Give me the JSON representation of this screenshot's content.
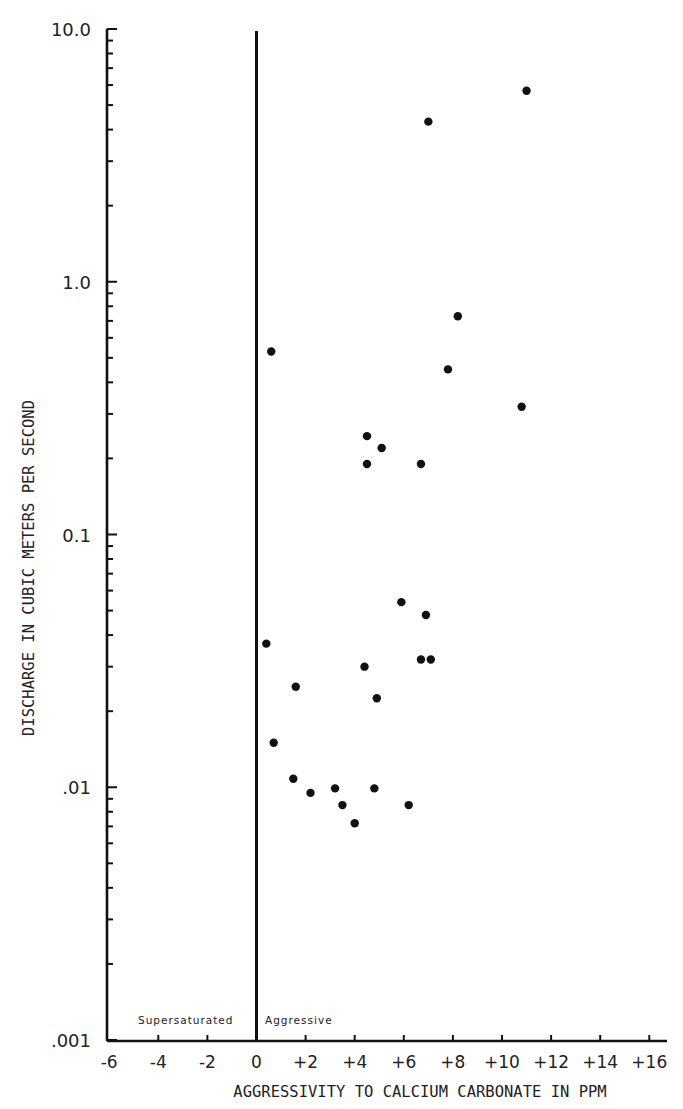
{
  "chart_data": {
    "type": "scatter",
    "title": "",
    "xlabel": "AGGRESSIVITY TO CALCIUM CARBONATE IN PPM",
    "ylabel": "DISCHARGE IN CUBIC METERS PER SECOND",
    "xlim": [
      -6,
      16.7
    ],
    "ylim": [
      0.001,
      10.0
    ],
    "yscale": "log",
    "grid": false,
    "legend": null,
    "x_ticks": [
      -6,
      -4,
      -2,
      0,
      2,
      4,
      6,
      8,
      10,
      12,
      14,
      16
    ],
    "x_tick_labels": [
      "-6",
      "-4",
      "-2",
      "0",
      "+2",
      "+4",
      "+6",
      "+8",
      "+10",
      "+12",
      "+14",
      "+16"
    ],
    "y_ticks": [
      0.001,
      0.01,
      0.1,
      1.0,
      10.0
    ],
    "y_tick_labels": [
      ".001",
      ".01",
      "0.1",
      "1.0",
      "10.0"
    ],
    "reference_line": {
      "x": 0,
      "style": "solid vertical"
    },
    "annotations": [
      {
        "text": "Supersaturated",
        "position": "left of x=0, near bottom"
      },
      {
        "text": "Aggressive",
        "position": "right of x=0, near bottom"
      }
    ],
    "series": [
      {
        "name": "samples",
        "points": [
          {
            "x": 11.0,
            "y": 5.7
          },
          {
            "x": 7.0,
            "y": 4.3
          },
          {
            "x": 8.2,
            "y": 0.73
          },
          {
            "x": 0.6,
            "y": 0.53
          },
          {
            "x": 7.8,
            "y": 0.45
          },
          {
            "x": 10.8,
            "y": 0.32
          },
          {
            "x": 4.5,
            "y": 0.245
          },
          {
            "x": 5.1,
            "y": 0.22
          },
          {
            "x": 4.5,
            "y": 0.19
          },
          {
            "x": 6.7,
            "y": 0.19
          },
          {
            "x": 5.9,
            "y": 0.054
          },
          {
            "x": 6.9,
            "y": 0.048
          },
          {
            "x": 0.4,
            "y": 0.037
          },
          {
            "x": 6.7,
            "y": 0.032
          },
          {
            "x": 7.1,
            "y": 0.032
          },
          {
            "x": 4.4,
            "y": 0.03
          },
          {
            "x": 1.6,
            "y": 0.025
          },
          {
            "x": 4.9,
            "y": 0.0225
          },
          {
            "x": 0.7,
            "y": 0.015
          },
          {
            "x": 1.5,
            "y": 0.0108
          },
          {
            "x": 3.2,
            "y": 0.0099
          },
          {
            "x": 4.8,
            "y": 0.0099
          },
          {
            "x": 2.2,
            "y": 0.0095
          },
          {
            "x": 3.5,
            "y": 0.0085
          },
          {
            "x": 6.2,
            "y": 0.0085
          },
          {
            "x": 4.0,
            "y": 0.0072
          }
        ]
      }
    ]
  },
  "layout": {
    "x_origin_px": 256.5,
    "x_px_per_unit": 24.55,
    "y_top_px": 29,
    "y_px_per_decade": 252.75,
    "axis_left_px": 107,
    "axis_bottom_px": 1041,
    "axis_right_px": 667,
    "point_radius": 4.2,
    "ink_color": "#111111"
  }
}
